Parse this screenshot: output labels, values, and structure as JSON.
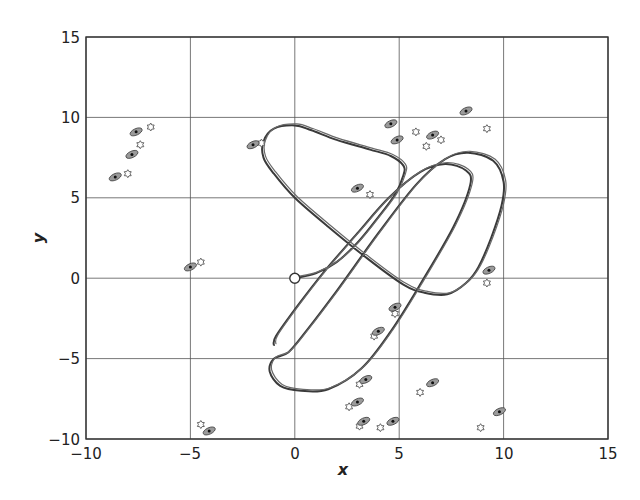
{
  "chart_data": {
    "type": "scatter",
    "title": "",
    "xlabel": "x",
    "ylabel": "y",
    "xlim": [
      -10,
      15
    ],
    "ylim": [
      -10,
      15
    ],
    "x_ticks": [
      -10,
      -5,
      0,
      5,
      10,
      15
    ],
    "y_ticks": [
      -10,
      -5,
      0,
      5,
      10,
      15
    ],
    "x_tick_labels": [
      "−10",
      "−5",
      "0",
      "5",
      "10",
      "15"
    ],
    "y_tick_labels": [
      "−10",
      "−5",
      "0",
      "5",
      "10",
      "15"
    ],
    "grid": true,
    "legend": null,
    "start_marker": {
      "x": 0,
      "y": 0,
      "shape": "open-circle"
    },
    "series": [
      {
        "name": "trajectory",
        "kind": "line",
        "description": "Looping vehicle path starting at origin (three lobes, doubled strokes)",
        "points": [
          [
            0,
            0
          ],
          [
            1,
            0.3
          ],
          [
            2,
            1.0
          ],
          [
            3,
            2.2
          ],
          [
            4,
            3.8
          ],
          [
            4.8,
            5.2
          ],
          [
            5.2,
            6.4
          ],
          [
            5.2,
            7
          ],
          [
            4.6,
            7.6
          ],
          [
            3.6,
            8.0
          ],
          [
            2,
            8.6
          ],
          [
            0.8,
            9.2
          ],
          [
            0,
            9.5
          ],
          [
            -1,
            9.3
          ],
          [
            -1.5,
            8.5
          ],
          [
            -1.5,
            7.5
          ],
          [
            -1,
            6.5
          ],
          [
            0,
            5
          ],
          [
            1.6,
            3.2
          ],
          [
            3.5,
            1.2
          ],
          [
            5.2,
            -0.4
          ],
          [
            6.2,
            -0.9
          ],
          [
            7.3,
            -1
          ],
          [
            8.2,
            -0.3
          ],
          [
            8.8,
            0.7
          ],
          [
            9.4,
            2.5
          ],
          [
            9.9,
            4.5
          ],
          [
            10,
            6
          ],
          [
            9.5,
            7.3
          ],
          [
            8.3,
            7.8
          ],
          [
            7.2,
            7.4
          ],
          [
            5.8,
            5.8
          ],
          [
            4.0,
            2.8
          ],
          [
            2.0,
            -0.8
          ],
          [
            0.6,
            -3.2
          ],
          [
            -0.3,
            -4.6
          ],
          [
            -1.0,
            -5.0
          ],
          [
            -1.2,
            -5.8
          ],
          [
            -0.7,
            -6.7
          ],
          [
            0.3,
            -7
          ],
          [
            1.6,
            -6.9
          ],
          [
            3.2,
            -5.6
          ],
          [
            4.6,
            -3.3
          ],
          [
            6,
            -0.4
          ],
          [
            7.6,
            3.2
          ],
          [
            8.4,
            5.8
          ],
          [
            8.2,
            6.7
          ],
          [
            7.2,
            7.1
          ],
          [
            6.0,
            6.6
          ],
          [
            4.5,
            5.0
          ],
          [
            3.0,
            2.8
          ],
          [
            1.4,
            0.4
          ],
          [
            0.2,
            -1.6
          ],
          [
            -0.9,
            -3.6
          ],
          [
            -1.0,
            -4.2
          ]
        ]
      },
      {
        "name": "estimates",
        "kind": "ellipse-with-dot",
        "points": [
          [
            -8.6,
            6.3
          ],
          [
            -7.8,
            7.7
          ],
          [
            -7.6,
            9.1
          ],
          [
            -2.0,
            8.3
          ],
          [
            -5.0,
            0.7
          ],
          [
            -4.1,
            -9.5
          ],
          [
            3.0,
            5.6
          ],
          [
            4.6,
            9.6
          ],
          [
            4.9,
            8.6
          ],
          [
            6.6,
            8.9
          ],
          [
            8.2,
            10.4
          ],
          [
            9.3,
            0.5
          ],
          [
            4.8,
            -1.8
          ],
          [
            4.0,
            -3.3
          ],
          [
            3.4,
            -6.3
          ],
          [
            3.0,
            -7.7
          ],
          [
            3.3,
            -8.9
          ],
          [
            4.7,
            -8.9
          ],
          [
            6.6,
            -6.5
          ],
          [
            9.8,
            -8.3
          ]
        ]
      },
      {
        "name": "true_positions",
        "kind": "open-star",
        "points": [
          [
            -8.0,
            6.5
          ],
          [
            -7.4,
            8.3
          ],
          [
            -6.9,
            9.4
          ],
          [
            -1.6,
            8.4
          ],
          [
            -4.5,
            1.0
          ],
          [
            -4.5,
            -9.1
          ],
          [
            3.6,
            5.2
          ],
          [
            5.8,
            9.1
          ],
          [
            6.3,
            8.2
          ],
          [
            7.0,
            8.6
          ],
          [
            9.2,
            9.3
          ],
          [
            9.2,
            -0.3
          ],
          [
            4.8,
            -2.2
          ],
          [
            3.8,
            -3.6
          ],
          [
            3.1,
            -6.6
          ],
          [
            2.6,
            -8.0
          ],
          [
            3.1,
            -9.2
          ],
          [
            4.1,
            -9.3
          ],
          [
            6.0,
            -7.1
          ],
          [
            8.9,
            -9.3
          ]
        ]
      }
    ]
  },
  "axes": {
    "x_label": "x",
    "y_label": "y",
    "x_ticks": [
      "−10",
      "−5",
      "0",
      "5",
      "10",
      "15"
    ],
    "y_ticks": [
      "−10",
      "−5",
      "0",
      "5",
      "10",
      "15"
    ]
  }
}
